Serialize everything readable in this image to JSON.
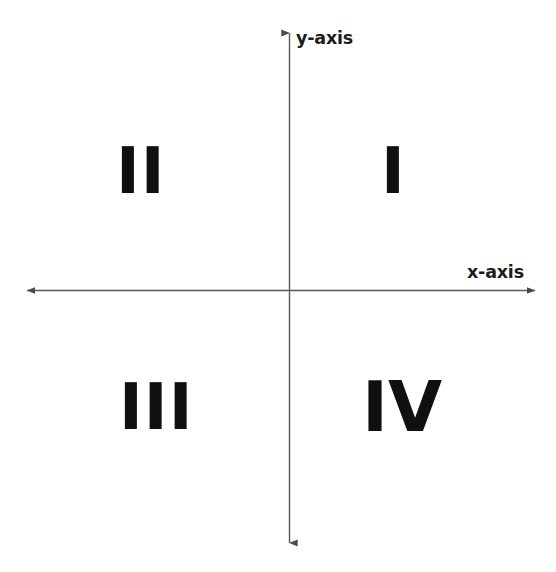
{
  "diagram": {
    "background_color": "#ffffff",
    "axis_color": "#5a5a5a",
    "text_color": "#1c1c1c",
    "numeral_color": "#101010"
  },
  "axes": {
    "x": {
      "label": "x-axis",
      "orientation": "horizontal",
      "start_px": 22,
      "end_px": 540,
      "position_y_px": 290,
      "arrow_start": true,
      "arrow_end": true
    },
    "y": {
      "label": "y-axis",
      "orientation": "vertical",
      "start_px": 28,
      "end_px": 548,
      "position_x_px": 289,
      "arrow_start": true,
      "arrow_end": true
    },
    "origin": {
      "x_px": 289,
      "y_px": 290
    }
  },
  "quadrants": [
    {
      "numeral": "I",
      "name": "quadrant-one",
      "position": "upper-right",
      "signs": "x positive, y positive"
    },
    {
      "numeral": "II",
      "name": "quadrant-two",
      "position": "upper-left",
      "signs": "x negative, y positive"
    },
    {
      "numeral": "III",
      "name": "quadrant-three",
      "position": "lower-left",
      "signs": "x negative, y negative"
    },
    {
      "numeral": "IV",
      "name": "quadrant-four",
      "position": "lower-right",
      "signs": "x positive, y negative"
    }
  ]
}
